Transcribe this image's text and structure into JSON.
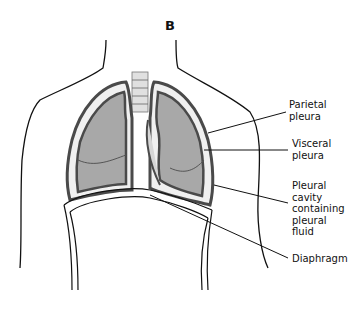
{
  "figure": {
    "panel_letter": "B",
    "colors": {
      "lung_fill": "#a8a8a8",
      "pleura_stroke": "#4a4a4a",
      "outline": "#111111",
      "cavity_fill": "#d6d6d6",
      "background": "#ffffff"
    }
  },
  "labels": [
    {
      "id": "parietal",
      "text_lines": [
        "Parietal",
        "pleura"
      ]
    },
    {
      "id": "visceral",
      "text_lines": [
        "Visceral",
        "pleura"
      ]
    },
    {
      "id": "cavity",
      "text_lines": [
        "Pleural",
        "cavity",
        "containing",
        "pleural",
        "fluid"
      ]
    },
    {
      "id": "diaphragm",
      "text_lines": [
        "Diaphragm"
      ]
    }
  ]
}
